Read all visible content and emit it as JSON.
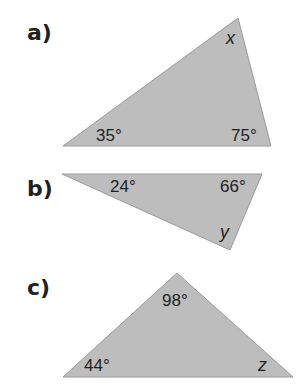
{
  "colors": {
    "triangle_fill": "#bdbdbd",
    "triangle_stroke": "#9a9a9a",
    "text": "#231f20",
    "background": "#ffffff"
  },
  "problems": [
    {
      "label": "a)",
      "vertices": [
        [
          63,
          146
        ],
        [
          238,
          18
        ],
        [
          271,
          146
        ]
      ],
      "angles": [
        {
          "text": "35°",
          "x": 96,
          "y": 141
        },
        {
          "text": "75°",
          "x": 231,
          "y": 141
        }
      ],
      "unknown": {
        "text": "x",
        "x": 226,
        "y": 44
      }
    },
    {
      "label": "b)",
      "vertices": [
        [
          62,
          174
        ],
        [
          262,
          174
        ],
        [
          230,
          250
        ]
      ],
      "angles": [
        {
          "text": "24°",
          "x": 110,
          "y": 192
        },
        {
          "text": "66°",
          "x": 220,
          "y": 192
        }
      ],
      "unknown": {
        "text": "y",
        "x": 220,
        "y": 238
      }
    },
    {
      "label": "c)",
      "vertices": [
        [
          63,
          377
        ],
        [
          177,
          273
        ],
        [
          293,
          377
        ]
      ],
      "angles": [
        {
          "text": "98°",
          "x": 162,
          "y": 306
        },
        {
          "text": "44°",
          "x": 84,
          "y": 371
        }
      ],
      "unknown": {
        "text": "z",
        "x": 258,
        "y": 371
      }
    }
  ]
}
